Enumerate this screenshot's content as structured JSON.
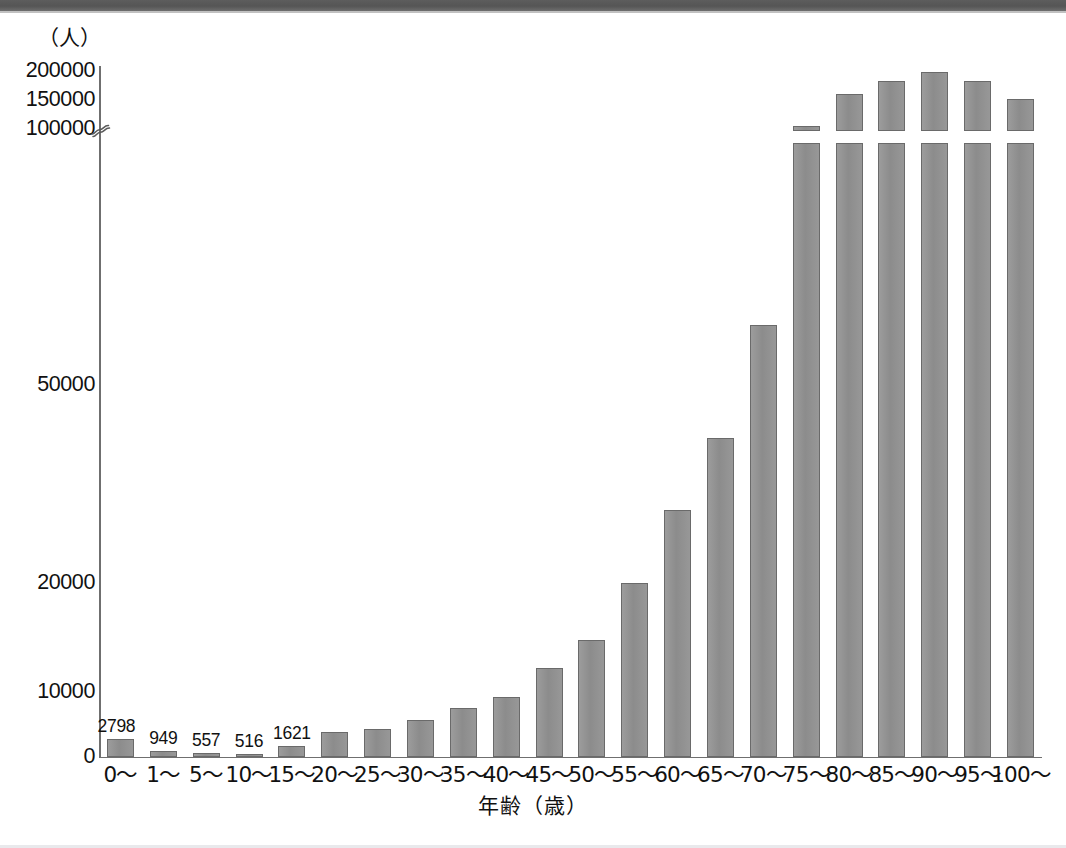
{
  "unit_caption": "（人）",
  "chart_data": {
    "type": "bar",
    "title": "",
    "subtitle": "",
    "xlabel": "年齢（歳）",
    "ylabel": "（人）",
    "grid": false,
    "legend": null,
    "axis_break": {
      "present": true,
      "marker": "squiggle",
      "between": [
        50000,
        100000
      ]
    },
    "ylim": [
      0,
      200000
    ],
    "ytick_labels": [
      "0",
      "10000",
      "20000",
      "50000",
      "100000",
      "150000",
      "200000"
    ],
    "yticks": [
      0,
      10000,
      20000,
      50000,
      100000,
      150000,
      200000
    ],
    "categories": [
      "0〜",
      "1〜",
      "5〜",
      "10〜",
      "15〜",
      "20〜",
      "25〜",
      "30〜",
      "35〜",
      "40〜",
      "45〜",
      "50〜",
      "55〜",
      "60〜",
      "65〜",
      "70〜",
      "75〜",
      "80〜",
      "85〜",
      "90〜",
      "95〜",
      "100〜"
    ],
    "values": [
      2798,
      949,
      557,
      516,
      1621,
      3900,
      4300,
      5700,
      7500,
      9200,
      12200,
      14800,
      20000,
      31000,
      42000,
      62000,
      105000,
      160000,
      183000,
      198000,
      183000,
      152000
    ],
    "values_full": [
      2798,
      949,
      557,
      516,
      1621,
      3900,
      4300,
      5700,
      7500,
      9200,
      12200,
      14800,
      20000,
      31000,
      42000,
      62000,
      105000,
      160000,
      183000,
      198000,
      183000,
      152000,
      72000,
      14000
    ],
    "data_labels": [
      "2798",
      "949",
      "557",
      "516",
      "1621"
    ],
    "series": [
      {
        "name": "人口",
        "values": [
          2798,
          949,
          557,
          516,
          1621,
          3900,
          4300,
          5700,
          7500,
          9200,
          12200,
          14800,
          20000,
          31000,
          42000,
          62000,
          105000,
          160000,
          183000,
          198000,
          183000,
          152000
        ]
      }
    ],
    "bar_color": "#919191",
    "bar_border_color": "#6a6a6a",
    "axis_color": "#6f6f6f"
  },
  "bars": [
    {
      "cat": "0〜",
      "value": 2798,
      "label": "2798",
      "label_offset": -4
    },
    {
      "cat": "1〜",
      "value": 949,
      "label": "949",
      "label_offset": 0
    },
    {
      "cat": "5〜",
      "value": 557,
      "label": "557",
      "label_offset": 0
    },
    {
      "cat": "10〜",
      "value": 516,
      "label": "516",
      "label_offset": 0
    },
    {
      "cat": "15〜",
      "value": 1621,
      "label": "1621",
      "label_offset": 0
    },
    {
      "cat": "20〜",
      "value": 3900,
      "label": "",
      "label_offset": 0
    },
    {
      "cat": "25〜",
      "value": 4300,
      "label": "",
      "label_offset": 0
    },
    {
      "cat": "30〜",
      "value": 5700,
      "label": "",
      "label_offset": 0
    },
    {
      "cat": "35〜",
      "value": 7500,
      "label": "",
      "label_offset": 0
    },
    {
      "cat": "40〜",
      "value": 9200,
      "label": "",
      "label_offset": 0
    },
    {
      "cat": "45〜",
      "value": 12200,
      "label": "",
      "label_offset": 0
    },
    {
      "cat": "50〜",
      "value": 14800,
      "label": "",
      "label_offset": 0
    },
    {
      "cat": "55〜",
      "value": 20000,
      "label": "",
      "label_offset": 0
    },
    {
      "cat": "60〜",
      "value": 31000,
      "label": "",
      "label_offset": 0
    },
    {
      "cat": "65〜",
      "value": 42000,
      "label": "",
      "label_offset": 0
    },
    {
      "cat": "70〜",
      "value": 62000,
      "label": "",
      "label_offset": 0
    },
    {
      "cat": "75〜",
      "value": 105000,
      "label": "",
      "label_offset": 0
    },
    {
      "cat": "80〜",
      "value": 160000,
      "label": "",
      "label_offset": 0
    },
    {
      "cat": "85〜",
      "value": 183000,
      "label": "",
      "label_offset": 0
    },
    {
      "cat": "90〜",
      "value": 198000,
      "label": "",
      "label_offset": 0
    },
    {
      "cat": "95〜",
      "value": 183000,
      "label": "",
      "label_offset": 0
    },
    {
      "cat": "100〜",
      "value": 152000,
      "label": "",
      "label_offset": 0
    }
  ]
}
